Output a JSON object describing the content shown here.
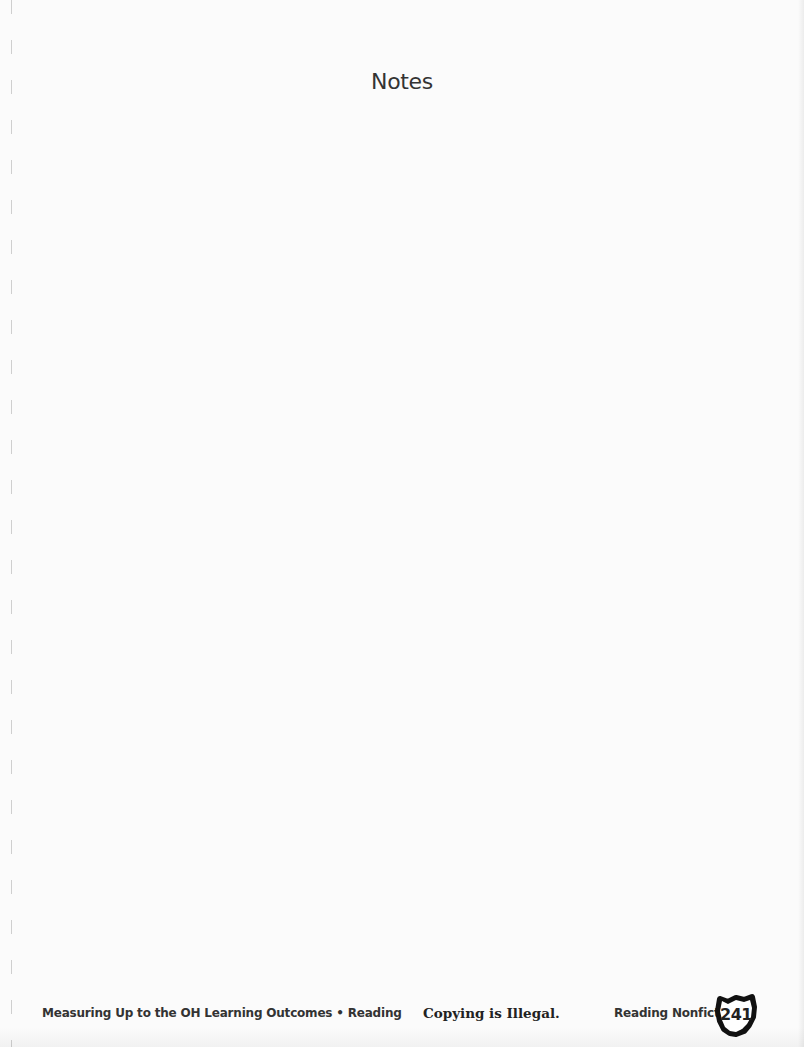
{
  "page": {
    "title": "Notes"
  },
  "footer": {
    "left_text": "Measuring Up to the OH Learning Outcomes • Reading",
    "center_text": "Copying is Illegal.",
    "right_text": "Reading Nonfiction",
    "page_number": "241",
    "badge_icon": "ohio-state-shape-icon"
  }
}
